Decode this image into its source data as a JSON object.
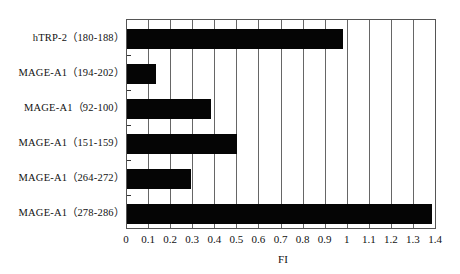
{
  "chart_data": {
    "type": "bar",
    "orientation": "horizontal",
    "title": "",
    "xlabel": "FI",
    "ylabel": "",
    "xlim": [
      0,
      1.4
    ],
    "x_ticks": [
      "0",
      "0.1",
      "0.2",
      "0.3",
      "0.4",
      "0.5",
      "0.6",
      "0.7",
      "0.8",
      "0.9",
      "1",
      "1.1",
      "1.2",
      "1.3",
      "1.4"
    ],
    "grid": {
      "vertical": true,
      "horizontal": false
    },
    "legend": null,
    "categories": [
      "hTRP-2（180-188）",
      "MAGE-A1（194-202）",
      "MAGE-A1（92-100）",
      "MAGE-A1（151-159）",
      "MAGE-A1（264-272）",
      "MAGE-A1（278-286）"
    ],
    "values": [
      0.98,
      0.13,
      0.38,
      0.5,
      0.29,
      1.38
    ],
    "colors": {
      "bar": "#050505",
      "grid": "#666666",
      "frame": "#555555",
      "background": "#ffffff"
    }
  }
}
